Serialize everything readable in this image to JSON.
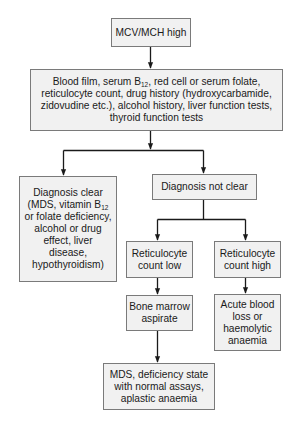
{
  "diagram": {
    "type": "flowchart",
    "colors": {
      "box_fill": "#f1f1f1",
      "box_border": "#7a7a7a",
      "connector": "#1a1a1a",
      "text": "#1a1a1a"
    },
    "nodes": {
      "start": {
        "label": "MCV/MCH high"
      },
      "investigations": {
        "line1_a": "Blood film, serum B",
        "line1_sub": "12",
        "line1_b": ", red cell or serum folate,",
        "line2": "reticulocyte count, drug history (hydroxycarbamide,",
        "line3": "zidovudine etc.), alcohol history, liver function tests,",
        "line4": "thyroid function tests"
      },
      "diagnosis_clear": {
        "line1": "Diagnosis clear",
        "line2_a": "(MDS, vitamin B",
        "line2_sub": "12",
        "line3": "or folate deficiency,",
        "line4": "alcohol or drug",
        "line5": "effect, liver",
        "line6": "disease,",
        "line7": "hypothyroidism)"
      },
      "diagnosis_not_clear": {
        "label": "Diagnosis not clear"
      },
      "retic_low": {
        "line1": "Reticulocyte",
        "line2": "count low"
      },
      "retic_high": {
        "line1": "Reticulocyte",
        "line2": "count high"
      },
      "bone_marrow": {
        "line1": "Bone marrow",
        "line2": "aspirate"
      },
      "acute_blood_loss": {
        "line1": "Acute blood",
        "line2": "loss or",
        "line3": "haemolytic",
        "line4": "anaemia"
      },
      "mds_outcome": {
        "line1": "MDS, deficiency state",
        "line2": "with normal assays,",
        "line3": "aplastic anaemia"
      }
    },
    "edges": [
      {
        "from": "start",
        "to": "investigations"
      },
      {
        "from": "investigations",
        "to": "diagnosis_clear"
      },
      {
        "from": "investigations",
        "to": "diagnosis_not_clear"
      },
      {
        "from": "diagnosis_not_clear",
        "to": "retic_low"
      },
      {
        "from": "diagnosis_not_clear",
        "to": "retic_high"
      },
      {
        "from": "retic_low",
        "to": "bone_marrow"
      },
      {
        "from": "retic_high",
        "to": "acute_blood_loss"
      },
      {
        "from": "bone_marrow",
        "to": "mds_outcome"
      }
    ]
  }
}
